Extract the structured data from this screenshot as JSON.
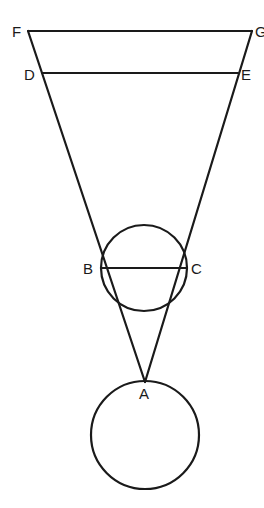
{
  "diagram": {
    "points": [
      {
        "id": "F",
        "label": "F"
      },
      {
        "id": "G",
        "label": "G"
      },
      {
        "id": "D",
        "label": "D"
      },
      {
        "id": "E",
        "label": "E"
      },
      {
        "id": "B",
        "label": "B"
      },
      {
        "id": "C",
        "label": "C"
      },
      {
        "id": "A",
        "label": "A"
      }
    ],
    "segments": [
      "FG",
      "DE",
      "BC",
      "FA",
      "GA"
    ],
    "circles": [
      {
        "name": "upper-circle",
        "through": [
          "B",
          "C"
        ],
        "diameter": "BC"
      },
      {
        "name": "lower-circle",
        "tangent_at": "A"
      }
    ]
  }
}
